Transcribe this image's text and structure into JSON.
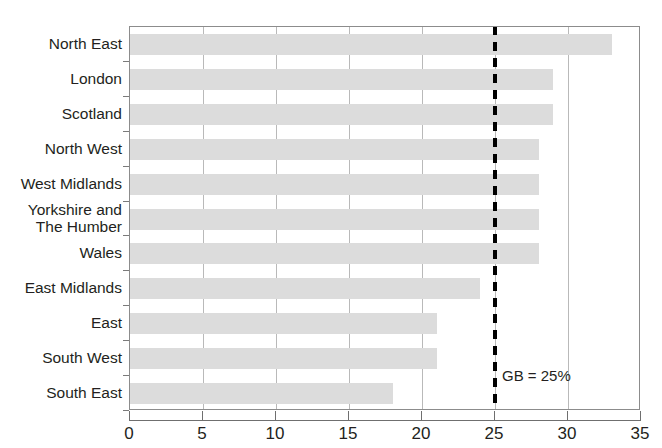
{
  "chart_data": {
    "type": "bar",
    "orientation": "horizontal",
    "title": "",
    "xlabel": "",
    "ylabel": "",
    "xlim": [
      0,
      35
    ],
    "xticks": [
      0,
      5,
      10,
      15,
      20,
      25,
      30,
      35
    ],
    "xtick_labels": [
      "0",
      "5",
      "10",
      "15",
      "20",
      "25",
      "30",
      "35"
    ],
    "grid": "vertical",
    "legend": "none",
    "categories": [
      "North East",
      "London",
      "Scotland",
      "North West",
      "West Midlands",
      "Yorkshire and\nThe Humber",
      "Wales",
      "East Midlands",
      "East",
      "South West",
      "South East"
    ],
    "values": [
      33,
      29,
      29,
      28,
      28,
      28,
      28,
      24,
      21,
      21,
      18
    ],
    "bar_color": "#dcdcdc",
    "annotations": [
      {
        "name": "gb-reference-line",
        "label": "GB = 25%",
        "value": 25,
        "style": "dashed",
        "color": "#000000"
      }
    ]
  },
  "axis": {
    "x_tick_labels": [
      "0",
      "5",
      "10",
      "15",
      "20",
      "25",
      "30",
      "35"
    ],
    "y_tick_labels": [
      "North East",
      "London",
      "Scotland",
      "North West",
      "West Midlands",
      "Yorkshire and\nThe Humber",
      "Wales",
      "East Midlands",
      "East",
      "South West",
      "South East"
    ]
  },
  "reference": {
    "label": "GB = 25%"
  },
  "title_sliver": ""
}
